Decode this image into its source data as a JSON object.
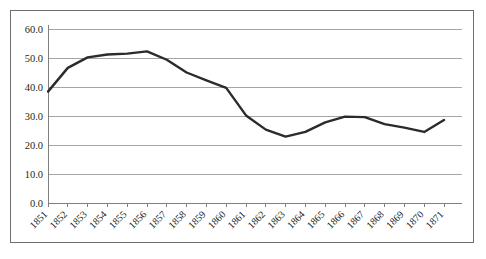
{
  "figure": {
    "border_color": "#6e6e6e",
    "background": "#ffffff"
  },
  "chart_data": {
    "type": "line",
    "title": "",
    "subtitle": "",
    "xlabel": "",
    "ylabel": "",
    "categories": [
      "1851",
      "1852",
      "1853",
      "1854",
      "1855",
      "1856",
      "1857",
      "1858",
      "1859",
      "1860",
      "1861",
      "1862",
      "1863",
      "1864",
      "1865",
      "1866",
      "1867",
      "1868",
      "1869",
      "1870",
      "1871"
    ],
    "values": [
      38.4,
      46.6,
      50.2,
      51.2,
      51.5,
      52.3,
      49.4,
      45.0,
      42.3,
      39.7,
      30.2,
      25.3,
      22.9,
      24.5,
      27.8,
      29.8,
      29.6,
      27.2,
      26.0,
      24.5,
      28.6
    ],
    "series": [
      {
        "name": "series-1",
        "color": "#2b2b2b",
        "values": [
          38.4,
          46.6,
          50.2,
          51.2,
          51.5,
          52.3,
          49.4,
          45.0,
          42.3,
          39.7,
          30.2,
          25.3,
          22.9,
          24.5,
          27.8,
          29.8,
          29.6,
          27.2,
          26.0,
          24.5,
          28.6
        ]
      }
    ],
    "ylim": [
      0,
      60
    ],
    "ytick_values": [
      60.0,
      50.0,
      40.0,
      30.0,
      20.0,
      10.0,
      0.0
    ],
    "ytick_labels": [
      "60.0",
      "50.0",
      "40.0",
      "30.0",
      "20.0",
      "10.0",
      "0.0"
    ],
    "grid": true,
    "grid_axis": "y",
    "legend": false,
    "legend_position": "none",
    "line_color": "#2b2b2b",
    "grid_color": "#a6a6a6",
    "axis_color": "#808080",
    "xtick_label_rotation": 45
  }
}
